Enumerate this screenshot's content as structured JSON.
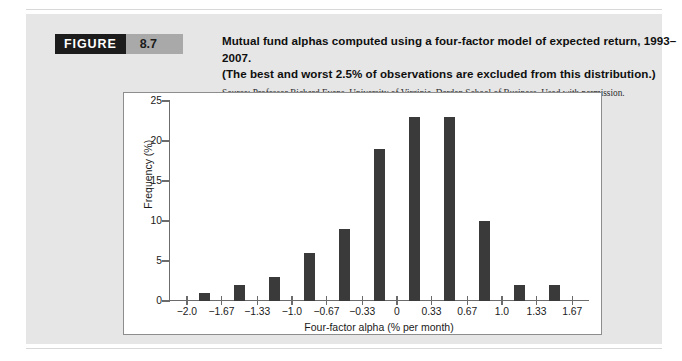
{
  "figure": {
    "tag_word": "FIGURE",
    "number": "8.7",
    "caption_line_1": "Mutual fund alphas computed using a four-factor model of expected return, 1993–2007.",
    "caption_line_2": "(The best and worst 2.5% of observations are excluded from this distribution.)",
    "source": "Source: Professor Richard Evans, University of Virginia, Darden School of Business. Used with permission."
  },
  "colors": {
    "tag_background": "#1c1c1c",
    "number_background": "#a9a9a9",
    "panel_background": "#e6e6e6",
    "chart_background": "#ffffff",
    "bar_fill": "#3a3a3a",
    "axis": "#6b6b6b"
  },
  "chart_data": {
    "type": "bar",
    "title": "",
    "xlabel": "Four-factor alpha (% per month)",
    "ylabel": "Frequency (%)",
    "xtick_labels": [
      "−2.0",
      "−1.67",
      "−1.33",
      "−1.0",
      "−0.67",
      "−0.33",
      "0",
      "0.33",
      "0.67",
      "1.0",
      "1.33",
      "1.67"
    ],
    "xtick_values": [
      -2.0,
      -1.67,
      -1.33,
      -1.0,
      -0.67,
      -0.33,
      0,
      0.33,
      0.67,
      1.0,
      1.33,
      1.67
    ],
    "ytick_labels": [
      "0",
      "5",
      "10",
      "15",
      "20",
      "25"
    ],
    "ytick_values": [
      0,
      5,
      10,
      15,
      20,
      25
    ],
    "ylim": [
      0,
      25
    ],
    "xlim": [
      -2.17,
      1.83
    ],
    "grid": false,
    "legend": false,
    "bin_centers": [
      -1.835,
      -1.5,
      -1.165,
      -0.835,
      -0.5,
      -0.165,
      0.165,
      0.5,
      0.835,
      1.165,
      1.5
    ],
    "categories": [
      "−2.0 to −1.67",
      "−1.67 to −1.33",
      "−1.33 to −1.0",
      "−1.0 to −0.67",
      "−0.67 to −0.33",
      "−0.33 to 0",
      "0 to 0.33",
      "0.33 to 0.67",
      "0.67 to 1.0",
      "1.0 to 1.33",
      "1.33 to 1.67"
    ],
    "values": [
      1,
      2,
      3,
      6,
      9,
      19,
      23,
      23,
      10,
      2,
      2
    ]
  }
}
